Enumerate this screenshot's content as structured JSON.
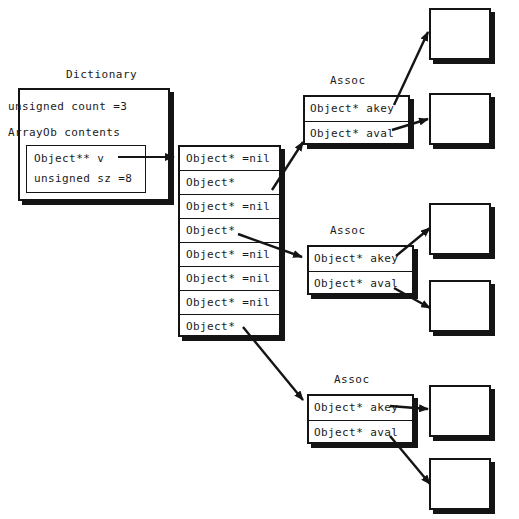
{
  "diagram": {
    "title_dictionary": "Dictionary",
    "dictionary": {
      "count_field": "unsigned count =3",
      "contents_field": "ArrayOb contents",
      "inner": {
        "v_field": "Object** v",
        "sz_field": "unsigned sz =8"
      }
    },
    "array": {
      "cells": [
        "Object* =nil",
        "Object*",
        "Object* =nil",
        "Object*",
        "Object* =nil",
        "Object* =nil",
        "Object* =nil",
        "Object*"
      ]
    },
    "assocs": [
      {
        "title": "Assoc",
        "akey": "Object* akey",
        "aval": "Object* aval"
      },
      {
        "title": "Assoc",
        "akey": "Object* akey",
        "aval": "Object* aval"
      },
      {
        "title": "Assoc",
        "akey": "Object* akey",
        "aval": "Object* aval"
      }
    ],
    "objects": [
      "",
      "",
      "",
      "",
      "",
      ""
    ],
    "colors": {
      "stroke": "#141414",
      "fill": "#ffffff",
      "text": "#1a1a1a"
    }
  }
}
